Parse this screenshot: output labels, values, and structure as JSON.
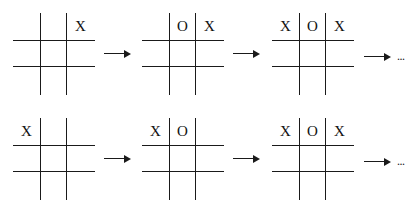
{
  "diagram": {
    "type": "tic-tac-toe game sequences",
    "rows": [
      {
        "boards": [
          {
            "cells": [
              "",
              "",
              "X",
              "",
              "",
              "",
              "",
              "",
              ""
            ]
          },
          {
            "cells": [
              "",
              "O",
              "X",
              "",
              "",
              "",
              "",
              "",
              ""
            ]
          },
          {
            "cells": [
              "X",
              "O",
              "X",
              "",
              "",
              "",
              "",
              "",
              ""
            ]
          }
        ],
        "continuation": "..."
      },
      {
        "boards": [
          {
            "cells": [
              "X",
              "",
              "",
              "",
              "",
              "",
              "",
              "",
              ""
            ]
          },
          {
            "cells": [
              "X",
              "O",
              "",
              "",
              "",
              "",
              "",
              "",
              ""
            ]
          },
          {
            "cells": [
              "X",
              "O",
              "X",
              "",
              "",
              "",
              "",
              "",
              ""
            ]
          }
        ],
        "continuation": "..."
      }
    ],
    "arrow_icon": "right-arrow-icon",
    "line_color": "#1a1a1a"
  }
}
